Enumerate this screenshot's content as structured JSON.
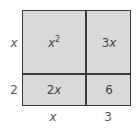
{
  "diagram": {
    "type": "area-model",
    "row_labels": [
      {
        "coef": "",
        "var": "x"
      },
      {
        "coef": "2",
        "var": ""
      }
    ],
    "column_labels": [
      {
        "coef": "",
        "var": "x"
      },
      {
        "coef": "3",
        "var": ""
      }
    ],
    "cells": {
      "top_left": {
        "coef": "",
        "var": "x",
        "exp": "2"
      },
      "top_right": {
        "coef": "3",
        "var": "x",
        "exp": ""
      },
      "bottom_left": {
        "coef": "2",
        "var": "x",
        "exp": ""
      },
      "bottom_right": {
        "coef": "6",
        "var": "",
        "exp": ""
      }
    },
    "colors": {
      "fill": "#d9d9d9",
      "border": "#3a3a3a",
      "text": "#444444"
    }
  }
}
